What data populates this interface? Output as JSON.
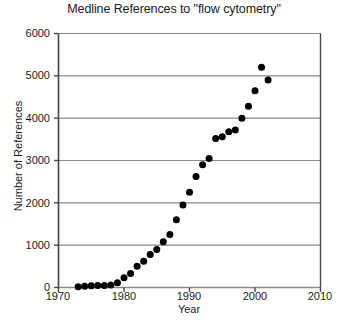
{
  "chart_data": {
    "type": "line",
    "title": "Medline References to \"flow cytometry\"",
    "xlabel": "Year",
    "ylabel": "Number of References",
    "xlim": [
      1970,
      2010
    ],
    "ylim": [
      0,
      6000
    ],
    "xticks": [
      1970,
      1980,
      1990,
      2000,
      2010
    ],
    "xtick_labels": [
      "1970",
      "1980",
      "1990",
      "2000",
      "2010"
    ],
    "yticks": [
      0,
      1000,
      2000,
      3000,
      4000,
      5000,
      6000
    ],
    "ytick_labels": [
      "0",
      "1000",
      "2000",
      "3000",
      "4000",
      "5000",
      "6000"
    ],
    "grid": "horizontal",
    "legend": "none",
    "marker": "filled-circle",
    "marker_color": "#000000",
    "line_color": "#000000",
    "x": [
      1973,
      1974,
      1975,
      1976,
      1977,
      1978,
      1979,
      1980,
      1981,
      1982,
      1983,
      1984,
      1985,
      1986,
      1987,
      1988,
      1989,
      1990,
      1991,
      1992,
      1993,
      1994,
      1995,
      1996,
      1997,
      1998,
      1999,
      2000,
      2001,
      2002
    ],
    "values": [
      20,
      30,
      40,
      45,
      50,
      60,
      110,
      230,
      330,
      500,
      620,
      780,
      900,
      1080,
      1250,
      1600,
      1950,
      2250,
      2620,
      2900,
      3050,
      3520,
      3560,
      3680,
      3720,
      4000,
      4280,
      4650,
      5200,
      4900
    ],
    "series": [
      {
        "name": "Medline references",
        "values": [
          20,
          30,
          40,
          45,
          50,
          60,
          110,
          230,
          330,
          500,
          620,
          780,
          900,
          1080,
          1250,
          1600,
          1950,
          2250,
          2620,
          2900,
          3050,
          3520,
          3560,
          3680,
          3720,
          4000,
          4280,
          4650,
          5200,
          4900
        ]
      }
    ]
  },
  "colors": {
    "axis": "#444444",
    "grid": "#8a8a8a",
    "marker": "#000000",
    "background": "#ffffff"
  }
}
